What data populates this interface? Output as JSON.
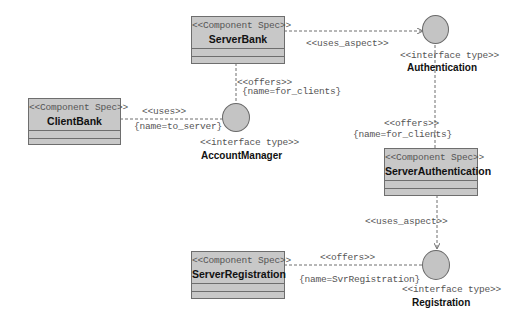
{
  "diagram": {
    "type": "UML component specification diagram",
    "colors": {
      "component_fill": "#c8c8c8",
      "interface_fill": "#c4c4c4",
      "stroke": "#6e6e6e",
      "label_text": "#555555",
      "name_text": "#111111",
      "background": "#ffffff"
    },
    "components": [
      {
        "id": "server_bank",
        "stereotype": "<<Component Spec>>",
        "name": "ServerBank"
      },
      {
        "id": "client_bank",
        "stereotype": "<<Component Spec>>",
        "name": "ClientBank"
      },
      {
        "id": "server_authentication",
        "stereotype": "<<Component Spec>>",
        "name": "ServerAuthentication"
      },
      {
        "id": "server_registration",
        "stereotype": "<<Component Spec>>",
        "name": "ServerRegistration"
      }
    ],
    "interfaces": [
      {
        "id": "authentication",
        "stereotype": "<<interface type>>",
        "name": "Authentication"
      },
      {
        "id": "account_manager",
        "stereotype": "<<interface type>>",
        "name": "AccountManager"
      },
      {
        "id": "registration",
        "stereotype": "<<interface type>>",
        "name": "Registration"
      }
    ],
    "connectors": [
      {
        "from": "ServerBank",
        "to": "Authentication",
        "stereotype": "<<uses_aspect>>",
        "constraint": ""
      },
      {
        "from": "ServerBank",
        "to": "AccountManager",
        "stereotype": "<<offers>>",
        "constraint": "{name=for_clients}"
      },
      {
        "from": "ClientBank",
        "to": "AccountManager",
        "stereotype": "<<uses>>",
        "constraint": "{name=to_server}"
      },
      {
        "from": "ServerAuthentication",
        "to": "Authentication",
        "stereotype": "<<offers>>",
        "constraint": "{name=for_clients}"
      },
      {
        "from": "ServerAuthentication",
        "to": "Registration",
        "stereotype": "<<uses_aspect>>",
        "constraint": ""
      },
      {
        "from": "ServerRegistration",
        "to": "Registration",
        "stereotype": "<<offers>>",
        "constraint": "{name=SvrRegistration}"
      }
    ]
  }
}
